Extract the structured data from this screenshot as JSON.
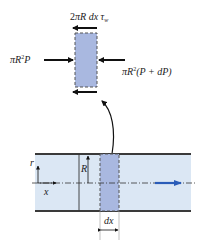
{
  "diagram": {
    "free_body": {
      "shear_label_parts": [
        "2",
        "πR",
        " dx ",
        "τ",
        "w"
      ],
      "left_force_label_parts": [
        "πR",
        "2",
        "P"
      ],
      "right_force_label_parts": [
        "πR",
        "2",
        "(P + dP)"
      ]
    },
    "pipe": {
      "radial_axis_label": "r",
      "axial_axis_label": "x",
      "radius_label": "R",
      "element_width_label": "dx"
    },
    "colors": {
      "element_fill": "#a9b8e0",
      "pipe_fill": "#dbe7f4",
      "pipe_wall": "#3a3a3a",
      "flow_arrow": "#2a5cb8",
      "arrows": "#111111"
    }
  }
}
